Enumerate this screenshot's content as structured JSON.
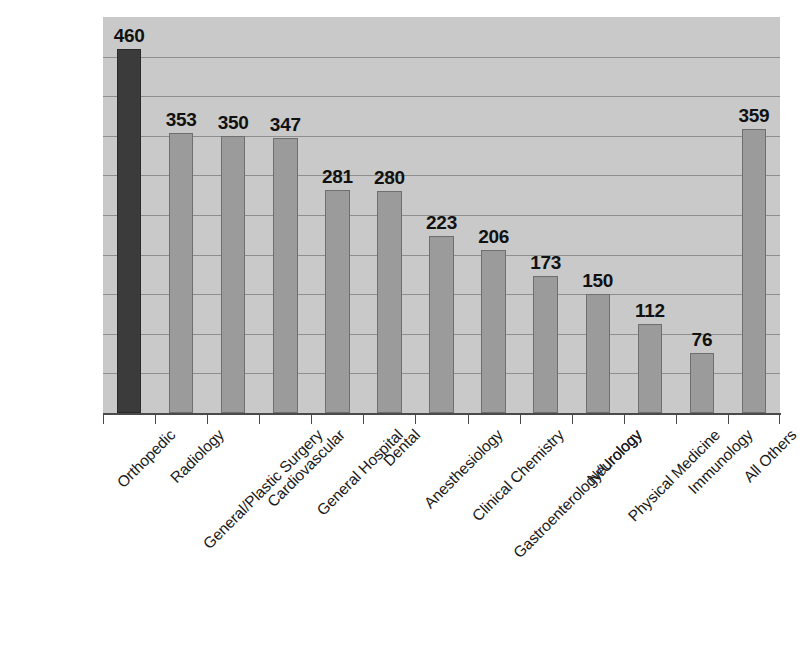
{
  "chart_data": {
    "type": "bar",
    "title": "",
    "subtitle": "",
    "xlabel": "",
    "ylabel": "",
    "ylim": [
      0,
      500
    ],
    "grid": true,
    "gridline_count": 9,
    "legend": "none",
    "orientation": "vertical",
    "label_rotation_degrees": -45,
    "categories": [
      "Orthopedic",
      "Radiology",
      "General/Plastic Surgery",
      "Cardiovascular",
      "General Hospital",
      "Dental",
      "Anesthesiology",
      "Clinical Chemistry",
      "Gastroenterology/Urology",
      "Neurology",
      "Physical Medicine",
      "Immunology",
      "All Others"
    ],
    "values": [
      460,
      353,
      350,
      347,
      281,
      280,
      223,
      206,
      173,
      150,
      112,
      76,
      359
    ],
    "value_labels": [
      "460",
      "353",
      "350",
      "347",
      "281",
      "280",
      "223",
      "206",
      "173",
      "150",
      "112",
      "76",
      "359"
    ],
    "highlight_index": 0,
    "colors": {
      "plot_background": "#c9c9c9",
      "gridline": "#8e8e8e",
      "bar": "#9b9b9b",
      "bar_border": "#6f6f6f",
      "bar_highlight": "#3b3b3b",
      "axis": "#4a4a4a",
      "text": "#111111",
      "page_background": "#ffffff"
    }
  }
}
